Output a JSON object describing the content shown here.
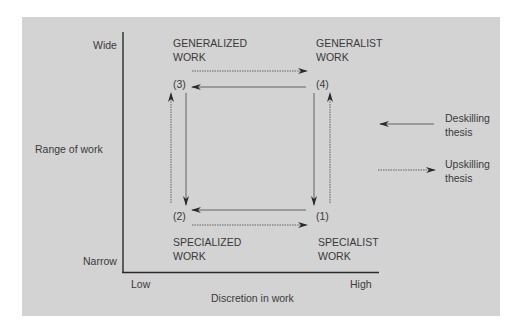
{
  "diagram": {
    "y_axis": {
      "label": "Range of work",
      "top_label": "Wide",
      "bottom_label": "Narrow"
    },
    "x_axis": {
      "label": "Discretion in work",
      "left_label": "Low",
      "right_label": "High"
    },
    "quadrants": {
      "top_left": {
        "number": "(3)",
        "line1": "GENERALIZED",
        "line2": "WORK"
      },
      "top_right": {
        "number": "(4)",
        "line1": "GENERALIST",
        "line2": "WORK"
      },
      "bottom_left": {
        "number": "(2)",
        "line1": "SPECIALIZED",
        "line2": "WORK"
      },
      "bottom_right": {
        "number": "(1)",
        "line1": "SPECIALIST",
        "line2": "WORK"
      }
    },
    "legend": {
      "deskilling": {
        "line1": "Deskilling",
        "line2": "thesis",
        "style": "solid"
      },
      "upskilling": {
        "line1": "Upskilling",
        "line2": "thesis",
        "style": "dotted"
      }
    },
    "colors": {
      "background": "#d3d3d3",
      "line": "#3a3a3a",
      "text": "#3a3a3a"
    }
  }
}
